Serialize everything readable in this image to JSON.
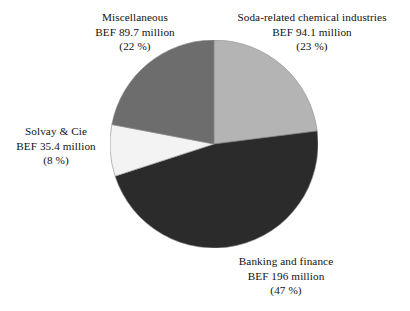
{
  "chart_data": {
    "type": "pie",
    "title": "",
    "subtitle": "",
    "xlabel": "",
    "ylabel": "",
    "units": "BEF million",
    "legend_position": "outside-labels",
    "grid": false,
    "start_angle_deg": 0,
    "direction": "clockwise",
    "categories": [
      "Soda-related chemical industries",
      "Banking and finance",
      "Solvay & Cie",
      "Miscellaneous"
    ],
    "values": [
      94.1,
      196,
      35.4,
      89.7
    ],
    "percentages": [
      23,
      47,
      8,
      22
    ],
    "colors": [
      "#b4b4b4",
      "#2b2b2b",
      "#f3f3f3",
      "#6d6d6d"
    ],
    "slices": [
      {
        "name": "Soda-related chemical industries",
        "value": 94.1,
        "percent": 23,
        "color": "#b4b4b4",
        "label_lines": [
          "Soda-related chemical industries",
          "BEF 94.1 million",
          "(23 %)"
        ]
      },
      {
        "name": "Banking and finance",
        "value": 196,
        "percent": 47,
        "color": "#2b2b2b",
        "label_lines": [
          "Banking and finance",
          "BEF 196 million",
          "(47 %)"
        ]
      },
      {
        "name": "Solvay & Cie",
        "value": 35.4,
        "percent": 8,
        "color": "#f3f3f3",
        "label_lines": [
          "Solvay & Cie",
          "BEF 35.4 million",
          "(8 %)"
        ]
      },
      {
        "name": "Miscellaneous",
        "value": 89.7,
        "percent": 22,
        "color": "#6d6d6d",
        "label_lines": [
          "Miscellaneous",
          "BEF 89.7 million",
          "(22 %)"
        ]
      }
    ]
  },
  "labels": {
    "miscellaneous": {
      "line1": "Miscellaneous",
      "line2": "BEF 89.7 million",
      "line3": "(22 %)"
    },
    "soda": {
      "line1": "Soda-related chemical industries",
      "line2": "BEF 94.1 million",
      "line3": "(23 %)"
    },
    "solvay": {
      "line1": "Solvay & Cie",
      "line2": "BEF 35.4 million",
      "line3": "(8 %)"
    },
    "banking": {
      "line1": "Banking and finance",
      "line2": "BEF 196 million",
      "line3": "(47 %)"
    }
  }
}
